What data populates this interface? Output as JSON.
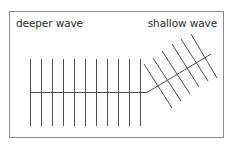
{
  "diagram": {
    "labels": {
      "deep": "deeper wave",
      "shallow": "shallow wave"
    },
    "colors": {
      "line": "#3a3a3a",
      "frame": "#8a8a8a",
      "text": "#2a2a2a"
    },
    "deep_wavefronts_count": 11,
    "shallow_wavefronts_count": 6
  }
}
